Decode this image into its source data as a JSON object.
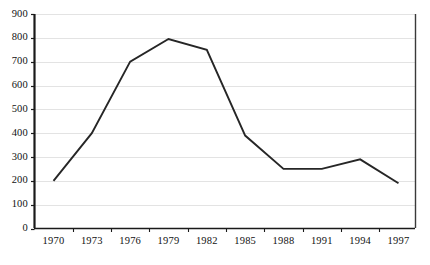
{
  "chart_data": {
    "type": "line",
    "title": "",
    "subtitle": "",
    "xlabel": "",
    "ylabel": "",
    "x": [
      1970,
      1973,
      1976,
      1979,
      1982,
      1985,
      1988,
      1991,
      1994,
      1997
    ],
    "categories": [
      "1970",
      "1973",
      "1976",
      "1979",
      "1982",
      "1985",
      "1988",
      "1991",
      "1994",
      "1997"
    ],
    "values": [
      200,
      400,
      700,
      795,
      750,
      390,
      250,
      250,
      290,
      190
    ],
    "series": [
      {
        "name": "series-1",
        "values": [
          200,
          400,
          700,
          795,
          750,
          390,
          250,
          250,
          290,
          190
        ]
      }
    ],
    "ylim": [
      0,
      900
    ],
    "ytick_labels": [
      "900",
      "800",
      "700",
      "600",
      "500",
      "400",
      "300",
      "200",
      "100",
      "0"
    ],
    "ytick_values": [
      900,
      800,
      700,
      600,
      500,
      400,
      300,
      200,
      100,
      0
    ],
    "xtick_labels": [
      "1970",
      "1973",
      "1976",
      "1979",
      "1982",
      "1985",
      "1988",
      "1991",
      "1994",
      "1997"
    ],
    "grid": true,
    "grid_axis": "y",
    "legend": false,
    "legend_position": "none",
    "line_color": "#262626",
    "grid_color": "#e3e3e3",
    "axis_color": "#1a1a1a",
    "plot_background": "#ffffff"
  }
}
